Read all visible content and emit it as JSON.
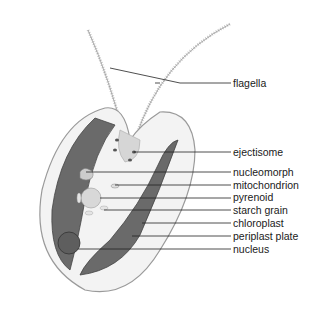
{
  "diagram": {
    "labels": [
      {
        "id": "flagella",
        "text": "flagella",
        "y": 77
      },
      {
        "id": "ejectisome",
        "text": "ejectisome",
        "y": 146
      },
      {
        "id": "nucleomorph",
        "text": "nucleomorph",
        "y": 166
      },
      {
        "id": "mitochondrion",
        "text": "mitochondrion",
        "y": 179
      },
      {
        "id": "pyrenoid",
        "text": "pyrenoid",
        "y": 191
      },
      {
        "id": "starch-grain",
        "text": "starch grain",
        "y": 204
      },
      {
        "id": "chloroplast",
        "text": "chloroplast",
        "y": 217
      },
      {
        "id": "periplast-plate",
        "text": "periplast plate",
        "y": 230
      },
      {
        "id": "nucleus",
        "text": "nucleus",
        "y": 243
      }
    ]
  }
}
